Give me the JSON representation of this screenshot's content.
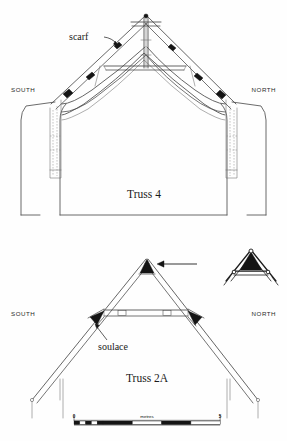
{
  "figure": {
    "kind": "architectural-measured-drawing",
    "background_color": "#fefefe",
    "ink_color": "#1a1a1a"
  },
  "panels": [
    {
      "id": "truss-4",
      "caption": "Truss 4",
      "orientation_left": "SOUTH",
      "orientation_right": "NORTH",
      "annotations": [
        {
          "id": "scarf",
          "label": "scarf"
        }
      ]
    },
    {
      "id": "truss-2a",
      "caption": "Truss 2A",
      "orientation_left": "SOUTH",
      "orientation_right": "NORTH",
      "annotations": [
        {
          "id": "soulace",
          "label": "soulace"
        }
      ],
      "inset": {
        "id": "apex-detail",
        "label": ""
      }
    }
  ],
  "scale_bar": {
    "start_label": "0",
    "end_label": "5",
    "unit_label": "metres",
    "segments": 4,
    "subdivisions": 5
  },
  "colors": {
    "ink": "#1a1a1a",
    "timber_line": "#4a4a4a",
    "hidden_line": "#8a8a8a",
    "fill_dark": "#141414",
    "paper": "#fefefe"
  }
}
